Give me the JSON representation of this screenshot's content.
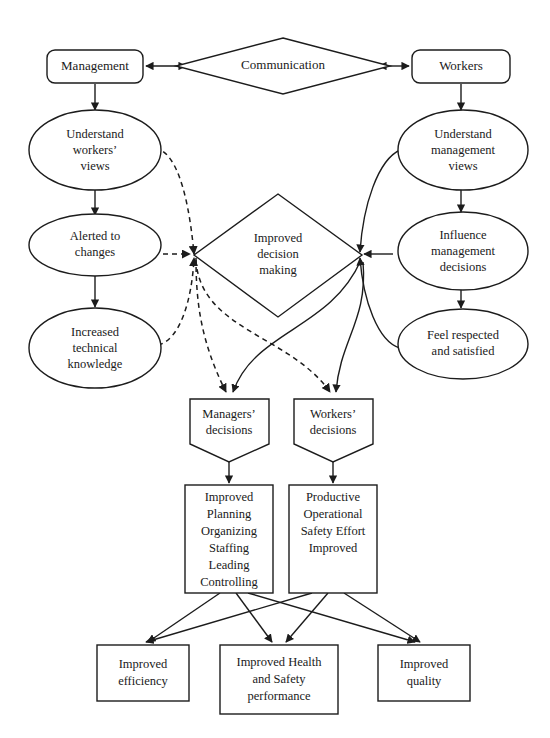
{
  "diagram": {
    "colors": {
      "stroke": "#1c1c1c",
      "fill": "#ffffff",
      "text": "#1a1a1a"
    },
    "nodes": {
      "management": {
        "label": "Management",
        "shape": "rounded-rect"
      },
      "communication": {
        "label": "Communication",
        "shape": "diamond"
      },
      "workers": {
        "label": "Workers",
        "shape": "rounded-rect"
      },
      "understand_workers_views": {
        "lines": [
          "Understand",
          "workers’",
          "views"
        ],
        "shape": "ellipse"
      },
      "alerted_to_changes": {
        "lines": [
          "Alerted to",
          "changes"
        ],
        "shape": "ellipse"
      },
      "increased_technical_knowledge": {
        "lines": [
          "Increased",
          "technical",
          "knowledge"
        ],
        "shape": "ellipse"
      },
      "understand_management_views": {
        "lines": [
          "Understand",
          "management",
          "views"
        ],
        "shape": "ellipse"
      },
      "influence_management_decisions": {
        "lines": [
          "Influence",
          "management",
          "decisions"
        ],
        "shape": "ellipse"
      },
      "feel_respected_and_satisfied": {
        "lines": [
          "Feel respected",
          "and satisfied"
        ],
        "shape": "ellipse"
      },
      "improved_decision_making": {
        "lines": [
          "Improved",
          "decision",
          "making"
        ],
        "shape": "diamond"
      },
      "managers_decisions": {
        "lines": [
          "Managers’",
          "decisions"
        ],
        "shape": "pentagon"
      },
      "workers_decisions": {
        "lines": [
          "Workers’",
          "decisions"
        ],
        "shape": "pentagon"
      },
      "management_functions": {
        "lines": [
          "Improved",
          "Planning",
          "Organizing",
          "Staffing",
          "Leading",
          "Controlling"
        ],
        "shape": "rect"
      },
      "productive_operational_safety": {
        "lines": [
          "Productive",
          "Operational",
          "Safety Effort",
          "Improved"
        ],
        "shape": "rect"
      },
      "improved_efficiency": {
        "lines": [
          "Improved",
          "efficiency"
        ],
        "shape": "rect"
      },
      "improved_health_safety": {
        "lines": [
          "Improved Health",
          "and Safety",
          "performance"
        ],
        "shape": "rect"
      },
      "improved_quality": {
        "lines": [
          "Improved",
          "quality"
        ],
        "shape": "rect"
      }
    },
    "edges": [
      {
        "from": "management",
        "to": "communication",
        "style": "solid",
        "arrow": "both"
      },
      {
        "from": "communication",
        "to": "workers",
        "style": "solid",
        "arrow": "both"
      },
      {
        "from": "management",
        "to": "understand_workers_views",
        "style": "solid",
        "arrow": "end"
      },
      {
        "from": "understand_workers_views",
        "to": "alerted_to_changes",
        "style": "solid",
        "arrow": "end"
      },
      {
        "from": "alerted_to_changes",
        "to": "increased_technical_knowledge",
        "style": "solid",
        "arrow": "end"
      },
      {
        "from": "workers",
        "to": "understand_management_views",
        "style": "solid",
        "arrow": "end"
      },
      {
        "from": "understand_management_views",
        "to": "influence_management_decisions",
        "style": "solid",
        "arrow": "end"
      },
      {
        "from": "influence_management_decisions",
        "to": "feel_respected_and_satisfied",
        "style": "solid",
        "arrow": "end"
      },
      {
        "from": "understand_workers_views",
        "to": "improved_decision_making",
        "style": "dashed",
        "arrow": "end"
      },
      {
        "from": "alerted_to_changes",
        "to": "improved_decision_making",
        "style": "dashed",
        "arrow": "end"
      },
      {
        "from": "increased_technical_knowledge",
        "to": "improved_decision_making",
        "style": "dashed",
        "arrow": "end"
      },
      {
        "from": "understand_management_views",
        "to": "improved_decision_making",
        "style": "solid",
        "arrow": "end"
      },
      {
        "from": "influence_management_decisions",
        "to": "improved_decision_making",
        "style": "solid",
        "arrow": "end"
      },
      {
        "from": "feel_respected_and_satisfied",
        "to": "improved_decision_making",
        "style": "solid",
        "arrow": "end"
      },
      {
        "from": "improved_decision_making",
        "to": "managers_decisions",
        "style": "dashed",
        "arrow": "end"
      },
      {
        "from": "improved_decision_making",
        "to": "workers_decisions",
        "style": "dashed",
        "arrow": "end"
      },
      {
        "from": "improved_decision_making",
        "to": "managers_decisions",
        "style": "solid",
        "arrow": "end"
      },
      {
        "from": "improved_decision_making",
        "to": "workers_decisions",
        "style": "solid",
        "arrow": "end"
      },
      {
        "from": "managers_decisions",
        "to": "management_functions",
        "style": "solid",
        "arrow": "end"
      },
      {
        "from": "workers_decisions",
        "to": "productive_operational_safety",
        "style": "solid",
        "arrow": "end"
      },
      {
        "from": "management_functions",
        "to": "improved_efficiency",
        "style": "solid",
        "arrow": "end"
      },
      {
        "from": "management_functions",
        "to": "improved_health_safety",
        "style": "solid",
        "arrow": "end"
      },
      {
        "from": "management_functions",
        "to": "improved_quality",
        "style": "solid",
        "arrow": "end"
      },
      {
        "from": "productive_operational_safety",
        "to": "improved_efficiency",
        "style": "solid",
        "arrow": "end"
      },
      {
        "from": "productive_operational_safety",
        "to": "improved_health_safety",
        "style": "solid",
        "arrow": "end"
      },
      {
        "from": "productive_operational_safety",
        "to": "improved_quality",
        "style": "solid",
        "arrow": "end"
      }
    ]
  }
}
